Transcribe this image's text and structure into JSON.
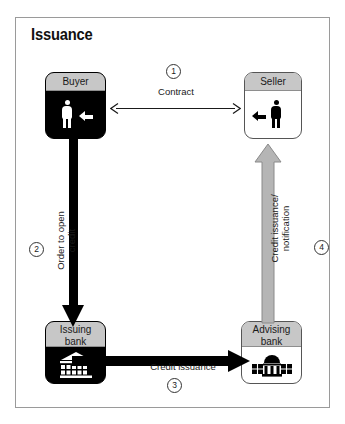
{
  "diagram": {
    "title": "Issuance",
    "type": "flow-diagram",
    "nodes": [
      {
        "id": "buyer",
        "label": "Buyer",
        "icon": "person-icon",
        "style": "dark"
      },
      {
        "id": "seller",
        "label": "Seller",
        "icon": "person-icon",
        "style": "light"
      },
      {
        "id": "issuing",
        "label_line1": "Issuing",
        "label_line2": "bank",
        "icon": "bank-building-icon",
        "style": "dark"
      },
      {
        "id": "advising",
        "label_line1": "Advising",
        "label_line2": "bank",
        "icon": "bank-building-icon",
        "style": "light"
      }
    ],
    "flows": [
      {
        "step": "1",
        "label": "Contract",
        "from": "buyer",
        "to": "seller",
        "arrow": "double-headed-thin"
      },
      {
        "step": "2",
        "label_line1": "Order to open",
        "label_line2": "credit",
        "from": "buyer",
        "to": "issuing",
        "arrow": "thick-black-down"
      },
      {
        "step": "3",
        "label": "Credit issuance",
        "from": "issuing",
        "to": "advising",
        "arrow": "thick-black-right"
      },
      {
        "step": "4",
        "label_line1": "Credit issuance/",
        "label_line2": "notification",
        "from": "advising",
        "to": "seller",
        "arrow": "gray-outlined-up"
      }
    ],
    "steps": {
      "one": "1",
      "two": "2",
      "three": "3",
      "four": "4"
    },
    "colors": {
      "dark_fill": "#000000",
      "light_fill": "#ffffff",
      "header_gray": "#c7c7c7",
      "gray_arrow": "#b5b5b5",
      "border": "#9a9a9a",
      "text": "#1a1a1a"
    }
  }
}
